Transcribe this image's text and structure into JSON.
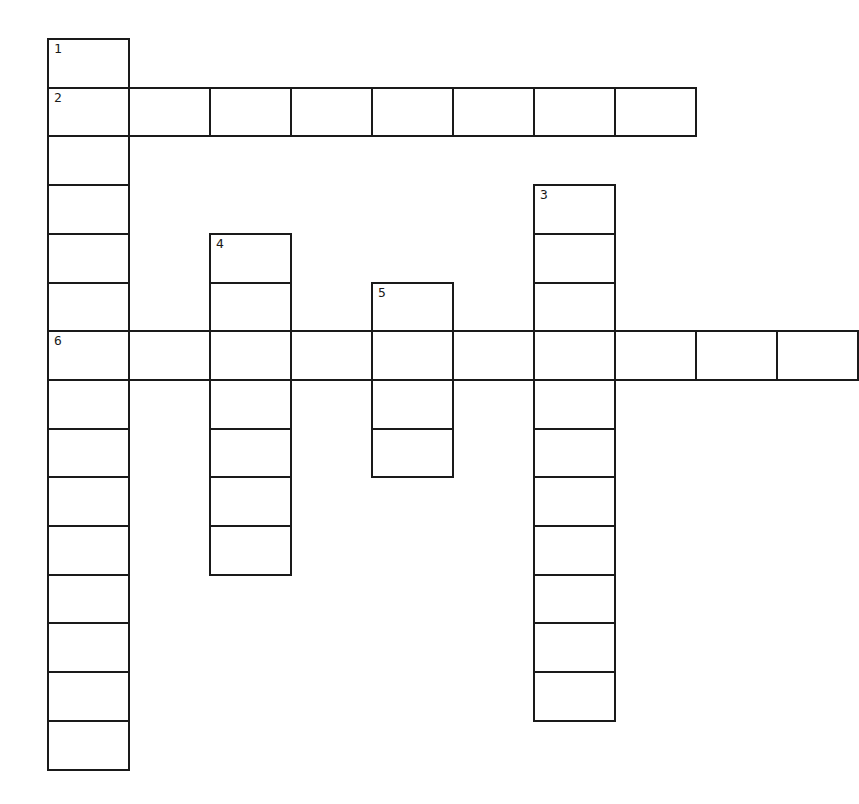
{
  "puzzle": {
    "title": "",
    "grid": {
      "origin_x": 47,
      "origin_y": 38,
      "cell_width": 81,
      "cell_height": 48.7,
      "border_color": "#1a1a1a",
      "background": "#ffffff"
    },
    "entries": [
      {
        "number": "1",
        "direction": "down",
        "row": 0,
        "col": 0,
        "length": 15
      },
      {
        "number": "2",
        "direction": "across",
        "row": 1,
        "col": 0,
        "length": 8
      },
      {
        "number": "3",
        "direction": "down",
        "row": 3,
        "col": 6,
        "length": 11
      },
      {
        "number": "4",
        "direction": "down",
        "row": 4,
        "col": 2,
        "length": 7
      },
      {
        "number": "5",
        "direction": "down",
        "row": 5,
        "col": 4,
        "length": 4
      },
      {
        "number": "6",
        "direction": "across",
        "row": 6,
        "col": 0,
        "length": 10
      }
    ]
  }
}
